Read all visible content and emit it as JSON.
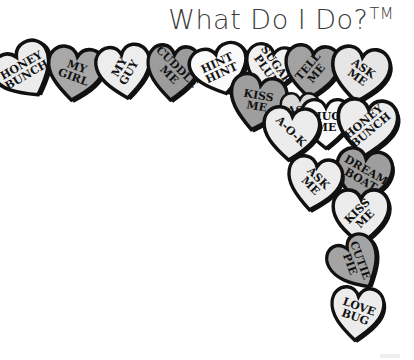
{
  "title": {
    "text": "What Do I Do?",
    "trademark": "TM"
  },
  "colors": {
    "light": "#ececec",
    "mid": "#a6a6a6",
    "white": "#fafafa",
    "outline": "#1a1a1a"
  },
  "hearts": [
    {
      "lines": [
        "HONEY",
        "BUNCH"
      ],
      "x": -6,
      "y": 44,
      "w": 62,
      "h": 56,
      "rot": -30,
      "fill": "#ececec",
      "textRot": -30
    },
    {
      "lines": [
        "MY",
        "GIRL"
      ],
      "x": 46,
      "y": 46,
      "w": 58,
      "h": 56,
      "rot": 8,
      "fill": "#a8a8a8",
      "textRot": 20
    },
    {
      "lines": [
        "MY",
        "GUY"
      ],
      "x": 96,
      "y": 44,
      "w": 56,
      "h": 56,
      "rot": -8,
      "fill": "#ededed",
      "textRot": -60
    },
    {
      "lines": [
        "CUDDLE",
        "ME"
      ],
      "x": 146,
      "y": 44,
      "w": 54,
      "h": 58,
      "rot": 5,
      "fill": "#9c9c9c",
      "textRot": 45
    },
    {
      "lines": [
        "HINT",
        "HINT"
      ],
      "x": 190,
      "y": 44,
      "w": 60,
      "h": 52,
      "rot": -15,
      "fill": "#fafafa",
      "textRot": -25
    },
    {
      "lines": [
        "SUGAR",
        "PLUM"
      ],
      "x": 244,
      "y": 44,
      "w": 54,
      "h": 52,
      "rot": 10,
      "fill": "#f0f0f0",
      "textRot": 55
    },
    {
      "lines": [
        "KISS",
        "ME"
      ],
      "x": 228,
      "y": 74,
      "w": 58,
      "h": 58,
      "rot": 12,
      "fill": "#9e9e9e",
      "textRot": 10
    },
    {
      "lines": [
        "TELL",
        "ME"
      ],
      "x": 284,
      "y": 44,
      "w": 56,
      "h": 56,
      "rot": 5,
      "fill": "#a2a2a2",
      "textRot": -50
    },
    {
      "lines": [
        "ASK",
        "ME"
      ],
      "x": 330,
      "y": 46,
      "w": 60,
      "h": 58,
      "rot": 8,
      "fill": "#e6e6e6",
      "textRot": 35
    },
    {
      "lines": [
        "ASK"
      ],
      "x": 280,
      "y": 92,
      "w": 40,
      "h": 40,
      "rot": 0,
      "fill": "#d8d8d8",
      "textRot": 0
    },
    {
      "lines": [
        "HUG",
        "ME"
      ],
      "x": 300,
      "y": 98,
      "w": 52,
      "h": 52,
      "rot": 0,
      "fill": "#fafafa",
      "textRot": 0
    },
    {
      "lines": [
        "A-O-K"
      ],
      "x": 262,
      "y": 106,
      "w": 58,
      "h": 56,
      "rot": 5,
      "fill": "#ececec",
      "textRot": 45
    },
    {
      "lines": [
        "HONEY",
        "BUNCH"
      ],
      "x": 336,
      "y": 98,
      "w": 62,
      "h": 60,
      "rot": 5,
      "fill": "#ececec",
      "textRot": -40
    },
    {
      "lines": [
        "DREAM",
        "BOAT"
      ],
      "x": 334,
      "y": 148,
      "w": 58,
      "h": 58,
      "rot": 10,
      "fill": "#9e9e9e",
      "textRot": 30
    },
    {
      "lines": [
        "ASK",
        "ME"
      ],
      "x": 286,
      "y": 156,
      "w": 56,
      "h": 56,
      "rot": 10,
      "fill": "#ececec",
      "textRot": 45
    },
    {
      "lines": [
        "KISS",
        "ME"
      ],
      "x": 332,
      "y": 188,
      "w": 58,
      "h": 58,
      "rot": 0,
      "fill": "#ececec",
      "textRot": -45
    },
    {
      "lines": [
        "CUTIE",
        "PIE"
      ],
      "x": 330,
      "y": 236,
      "w": 52,
      "h": 56,
      "rot": -30,
      "fill": "#a4a4a4",
      "textRot": 70
    },
    {
      "lines": [
        "LOVE",
        "BUG"
      ],
      "x": 330,
      "y": 286,
      "w": 54,
      "h": 56,
      "rot": 5,
      "fill": "#ececec",
      "textRot": 20
    }
  ]
}
